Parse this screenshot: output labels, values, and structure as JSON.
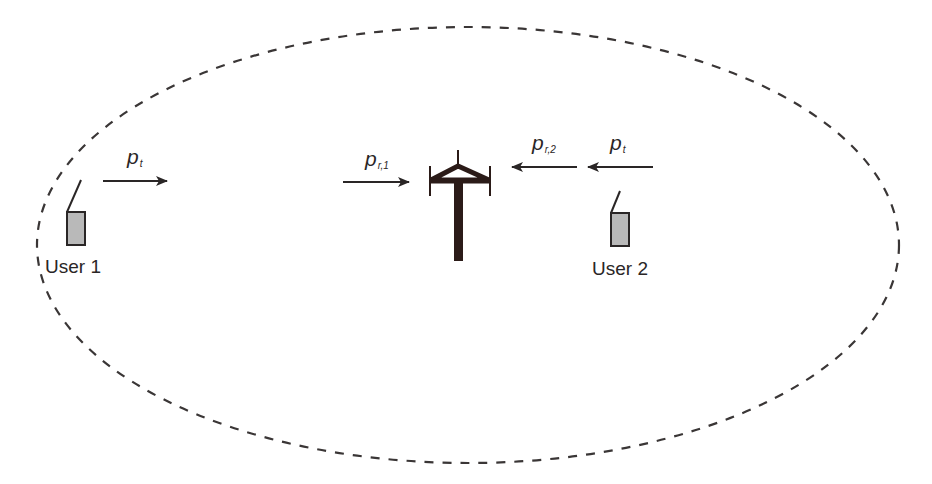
{
  "diagram": {
    "title": "",
    "cell_boundary": {
      "shape": "ellipse",
      "style": "dashed",
      "cx": 468,
      "cy": 245,
      "rx": 431,
      "ry": 218
    },
    "base_station": {
      "icon": "antenna-tower-icon",
      "x": 458,
      "y": 150
    },
    "users": [
      {
        "label": "User 1",
        "icon": "mobile-handset-icon",
        "x": 67,
        "y": 212
      },
      {
        "label": "User 2",
        "icon": "mobile-handset-icon",
        "x": 611,
        "y": 213
      }
    ],
    "signals": [
      {
        "id": "user1-transmit",
        "symbol": "p",
        "subscript": "t",
        "direction": "right",
        "x1": 103,
        "x2": 167,
        "y": 181
      },
      {
        "id": "user1-received",
        "symbol": "p",
        "subscript": "r,1",
        "direction": "right",
        "x1": 343,
        "x2": 409,
        "y": 182
      },
      {
        "id": "user2-received",
        "symbol": "p",
        "subscript": "r,2",
        "direction": "left",
        "x1": 577,
        "x2": 512,
        "y": 167
      },
      {
        "id": "user2-transmit",
        "symbol": "p",
        "subscript": "t",
        "direction": "left",
        "x1": 653,
        "x2": 588,
        "y": 167
      }
    ]
  },
  "colors": {
    "ink": "#2a2626",
    "handset_fill": "#b9b9b9",
    "tower": "#2b1b18",
    "background": "#ffffff"
  }
}
